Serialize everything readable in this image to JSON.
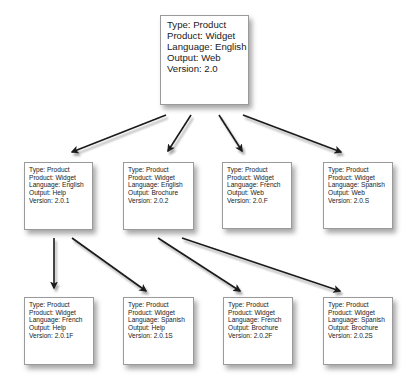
{
  "diagram": {
    "type": "tree",
    "root": {
      "id": "root",
      "lines": [
        "Type:  Product",
        "Product:  Widget",
        "Language:  English",
        "Output:  Web",
        "Version:  2.0"
      ]
    },
    "level1": [
      {
        "id": "n1",
        "lines": [
          "Type:  Product",
          "Product:  Widget",
          "Language:  English",
          "Output:  Help",
          "Version:  2.0.1"
        ]
      },
      {
        "id": "n2",
        "lines": [
          "Type:  Product",
          "Product:  Widget",
          "Language:  English",
          "Output:  Brochure",
          "Version:  2.0.2"
        ]
      },
      {
        "id": "n3",
        "lines": [
          "Type:  Product",
          "Product:  Widget",
          "Language: French",
          "Output:  Web",
          "Version:  2.0.F"
        ]
      },
      {
        "id": "n4",
        "lines": [
          "Type:  Product",
          "Product:  Widget",
          "Language: Spanish",
          "Output:  Web",
          "Version:  2.0.S"
        ]
      }
    ],
    "level2": [
      {
        "id": "n5",
        "lines": [
          "Type:  Product",
          "Product:  Widget",
          "Language: French",
          "Output:  Help",
          "Version:  2.0.1F"
        ]
      },
      {
        "id": "n6",
        "lines": [
          "Type:  Product",
          "Product:  Widget",
          "Language:  Spanish",
          "Output:  Help",
          "Version:  2.0.1S"
        ]
      },
      {
        "id": "n7",
        "lines": [
          "Type:  Product",
          "Product:  Widget",
          "Language: French",
          "Output: Brochure",
          "Version:  2.0.2F"
        ]
      },
      {
        "id": "n8",
        "lines": [
          "Type:  Product",
          "Product:  Widget",
          "Language: Spanish",
          "Output: Brochure",
          "Version:  2.0.2S"
        ]
      }
    ],
    "edges": [
      {
        "from": "root",
        "to": "n1"
      },
      {
        "from": "root",
        "to": "n2"
      },
      {
        "from": "root",
        "to": "n3"
      },
      {
        "from": "root",
        "to": "n4"
      },
      {
        "from": "n1",
        "to": "n5"
      },
      {
        "from": "n1",
        "to": "n6"
      },
      {
        "from": "n2",
        "to": "n7"
      },
      {
        "from": "n2",
        "to": "n8"
      }
    ],
    "colors": {
      "arrow": "#1a1a1a",
      "box_border": "#9a9a9a",
      "box_fill": "#ffffff",
      "text": "#1a1a1a"
    }
  }
}
